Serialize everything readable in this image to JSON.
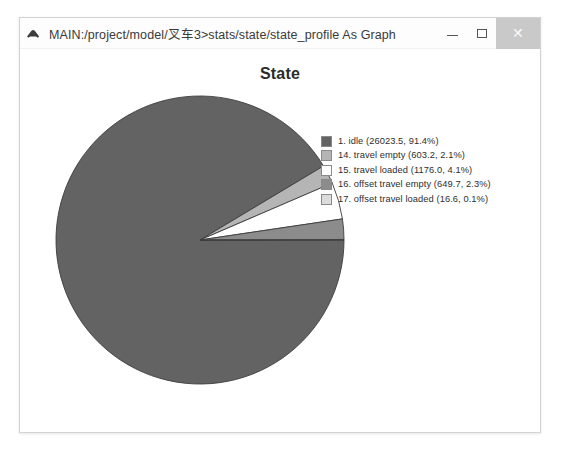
{
  "window": {
    "icon": "chart-peak-icon",
    "title": "MAIN:/project/model/叉车3>stats/state/state_profile As Graph",
    "buttons": {
      "minimize": "—",
      "maximize": "□",
      "close": "✕"
    }
  },
  "chart_data": {
    "type": "pie",
    "title": "State",
    "xlabel": "",
    "ylabel": "",
    "legend_position": "right",
    "start_angle_deg": 0,
    "direction": "clockwise",
    "categories": [
      "1. idle",
      "14. travel empty",
      "15. travel loaded",
      "16. offset travel empty",
      "17. offset travel loaded"
    ],
    "values": [
      26023.5,
      603.2,
      1176.0,
      649.7,
      16.6
    ],
    "percents": [
      91.4,
      2.1,
      4.1,
      2.3,
      0.1
    ],
    "colors": [
      "#636363",
      "#b5b5b5",
      "#ffffff",
      "#8c8c8c",
      "#dcdcdc"
    ],
    "slice_edge_color": "#3d3d3d",
    "legend_entries": [
      {
        "swatch": "#636363",
        "label": "1. idle (26023.5, 91.4%)"
      },
      {
        "swatch": "#b5b5b5",
        "label": "14. travel empty (603.2, 2.1%)"
      },
      {
        "swatch": "#ffffff",
        "label": "15. travel loaded (1176.0, 4.1%)"
      },
      {
        "swatch": "#8c8c8c",
        "label": "16. offset travel empty (649.7, 2.3%)"
      },
      {
        "swatch": "#dcdcdc",
        "label": "17. offset travel loaded (16.6, 0.1%)"
      }
    ]
  }
}
